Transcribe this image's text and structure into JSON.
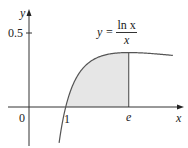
{
  "chart_data": {
    "type": "line",
    "title": "",
    "function": "y = ln x / x",
    "xlabel": "x",
    "ylabel": "y",
    "xlim": [
      -0.8,
      4.2
    ],
    "ylim": [
      -0.26,
      0.66
    ],
    "grid": false,
    "x_tick_labels": [
      "0",
      "1",
      "e"
    ],
    "x_tick_values": [
      0,
      1,
      2.718
    ],
    "y_tick_labels": [
      "0.5"
    ],
    "y_tick_values": [
      0.5
    ],
    "shaded_region": {
      "from_x": 1,
      "to_x": 2.718,
      "description": "area under curve between x=1 and x=e"
    },
    "x": [
      0.82,
      0.9,
      1.0,
      1.2,
      1.5,
      2.0,
      2.5,
      2.718,
      3.0,
      3.5,
      3.92
    ],
    "values": [
      -0.242,
      -0.117,
      0.0,
      0.152,
      0.27,
      0.347,
      0.367,
      0.368,
      0.366,
      0.358,
      0.349
    ],
    "annotations": [
      {
        "text": "y = ln x / x",
        "position": "above curve near peak"
      }
    ]
  },
  "labels": {
    "y_axis": "y",
    "x_axis": "x",
    "origin": "0",
    "tick_one": "1",
    "tick_e": "e",
    "tick_half": "0.5",
    "eq_lhs": "y =",
    "eq_num": "ln x",
    "eq_den": "x"
  },
  "colors": {
    "axis": "#333333",
    "curve": "#555555",
    "shade": "#e6e6e6"
  }
}
